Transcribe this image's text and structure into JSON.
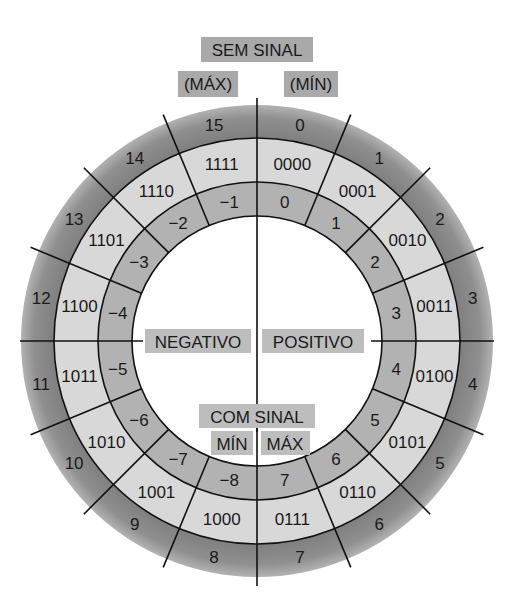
{
  "diagram": {
    "title_unsigned": "SEM SINAL",
    "unsigned_max_label": "(MÁX)",
    "unsigned_min_label": "(MÍN)",
    "negative_label": "NEGATIVO",
    "positive_label": "POSITIVO",
    "title_signed": "COM SINAL",
    "signed_min_label": "MÍN",
    "signed_max_label": "MÁX",
    "colors": {
      "outer_ring": "#8c8c8c",
      "binary_ring": "#d9d9d9",
      "signed_ring": "#b0b0b0",
      "label_box": "#a9a9a9",
      "lines": "#111111"
    },
    "sectors": [
      {
        "unsigned": "0",
        "binary": "0000",
        "signed": "0"
      },
      {
        "unsigned": "1",
        "binary": "0001",
        "signed": "1"
      },
      {
        "unsigned": "2",
        "binary": "0010",
        "signed": "2"
      },
      {
        "unsigned": "3",
        "binary": "0011",
        "signed": "3"
      },
      {
        "unsigned": "4",
        "binary": "0100",
        "signed": "4"
      },
      {
        "unsigned": "5",
        "binary": "0101",
        "signed": "5"
      },
      {
        "unsigned": "6",
        "binary": "0110",
        "signed": "6"
      },
      {
        "unsigned": "7",
        "binary": "0111",
        "signed": "7"
      },
      {
        "unsigned": "8",
        "binary": "1000",
        "signed": "−8"
      },
      {
        "unsigned": "9",
        "binary": "1001",
        "signed": "−7"
      },
      {
        "unsigned": "10",
        "binary": "1010",
        "signed": "−6"
      },
      {
        "unsigned": "11",
        "binary": "1011",
        "signed": "−5"
      },
      {
        "unsigned": "12",
        "binary": "1100",
        "signed": "−4"
      },
      {
        "unsigned": "13",
        "binary": "1101",
        "signed": "−3"
      },
      {
        "unsigned": "14",
        "binary": "1110",
        "signed": "−2"
      },
      {
        "unsigned": "15",
        "binary": "1111",
        "signed": "−1"
      }
    ]
  }
}
